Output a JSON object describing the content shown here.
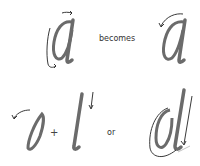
{
  "diagram": {
    "row1": {
      "left_glyph": "a",
      "connector": "becomes",
      "right_glyph": "a"
    },
    "row2": {
      "glyph_1": "o",
      "plus": "+",
      "glyph_2": "l",
      "connector": "or",
      "glyph_3": "d"
    }
  },
  "colors": {
    "stroke_ink": "#6b6b6b",
    "arrow_ink": "#222222",
    "background": "#ffffff"
  }
}
